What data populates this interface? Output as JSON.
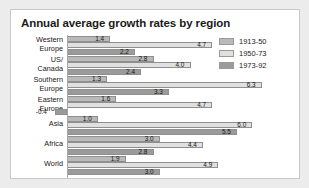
{
  "chart_data": {
    "type": "bar",
    "orientation": "horizontal",
    "title": "Annual average growth rates by region",
    "xlabel": "",
    "ylabel": "",
    "xlim": [
      -0.6,
      6.6
    ],
    "grid": false,
    "legend_position": "top-right",
    "categories": [
      "Western Europe",
      "US/ Canada",
      "Southern Europe",
      "Eastern Europe",
      "Asia",
      "Africa",
      "World"
    ],
    "category_lines": [
      [
        "Western",
        "Europe"
      ],
      [
        "US/",
        "Canada"
      ],
      [
        "Southern",
        "Europe"
      ],
      [
        "Eastern",
        "Europe"
      ],
      [
        "Asia"
      ],
      [
        "Africa"
      ],
      [
        "World"
      ]
    ],
    "series": [
      {
        "name": "1913-50",
        "color": "#b9b9b9",
        "values": [
          1.4,
          2.8,
          1.3,
          1.6,
          1.0,
          3.0,
          1.9
        ]
      },
      {
        "name": "1950-73",
        "color": "#e0e0e0",
        "values": [
          4.7,
          4.0,
          6.3,
          4.7,
          6.0,
          4.4,
          4.9
        ]
      },
      {
        "name": "1973-92",
        "color": "#9b9b9b",
        "values": [
          2.2,
          2.4,
          3.3,
          -0.4,
          5.5,
          2.8,
          3.0
        ]
      }
    ],
    "value_labels": [
      [
        "1.4",
        "4.7",
        "2.2"
      ],
      [
        "2.8",
        "4.0",
        "2.4"
      ],
      [
        "1.3",
        "6.3",
        "3.3"
      ],
      [
        "1.6",
        "4.7",
        "-0.4"
      ],
      [
        "1.0",
        "6.0",
        "5.5"
      ],
      [
        "3.0",
        "4.4",
        "2.8"
      ],
      [
        "1.9",
        "4.9",
        "3.0"
      ]
    ]
  },
  "legend": {
    "items": [
      {
        "label": "1913-50",
        "color": "#b9b9b9"
      },
      {
        "label": "1950-73",
        "color": "#e0e0e0"
      },
      {
        "label": "1973-92",
        "color": "#9b9b9b"
      }
    ]
  },
  "colors": {
    "panel_background": "#ffffff",
    "page_background": "#ececec",
    "panel_border": "#c8c8c8",
    "bar_outline": "#8f8f8f",
    "text": "#1b1b1b"
  }
}
